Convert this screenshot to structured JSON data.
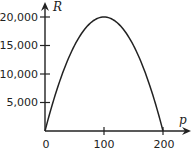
{
  "chart_data": {
    "type": "line",
    "title": "",
    "xlabel": "p",
    "ylabel": "R",
    "xlim": [
      0,
      200
    ],
    "ylim": [
      0,
      20000
    ],
    "x_ticks": [
      "0",
      "100",
      "200"
    ],
    "y_ticks": [
      "5,000",
      "10,000",
      "15,000",
      "20,000"
    ],
    "grid": false,
    "legend": null,
    "series": [
      {
        "name": "R(p)",
        "description": "downward parabola, zeros at p=0 and p=200, maximum 20,000 at p=100",
        "x": [
          0,
          25,
          50,
          75,
          100,
          125,
          150,
          175,
          200
        ],
        "values": [
          0,
          8750,
          15000,
          18750,
          20000,
          18750,
          15000,
          8750,
          0
        ]
      }
    ]
  },
  "axes": {
    "x_label": "p",
    "y_label": "R",
    "x_tick_labels": [
      "0",
      "100",
      "200"
    ],
    "y_tick_labels": [
      "5,000",
      "10,000",
      "15,000",
      "20,000"
    ]
  }
}
